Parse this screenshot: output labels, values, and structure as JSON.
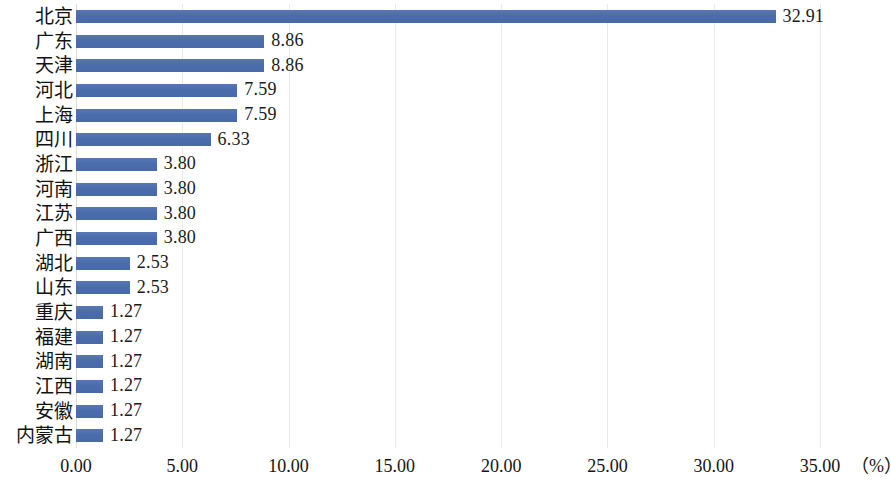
{
  "chart_data": {
    "type": "bar",
    "orientation": "horizontal",
    "title": "",
    "subtitle": "",
    "xlabel": "(%)",
    "ylabel": "",
    "xlim": [
      0,
      35
    ],
    "xticks": [
      "0.00",
      "5.00",
      "10.00",
      "15.00",
      "20.00",
      "25.00",
      "30.00",
      "35.00"
    ],
    "xtick_values": [
      0,
      5,
      10,
      15,
      20,
      25,
      30,
      35
    ],
    "grid": true,
    "grid_axis": "x",
    "legend": false,
    "bar_color": "#4c6fad",
    "value_label_format": "0.00",
    "categories": [
      "北京",
      "广东",
      "天津",
      "河北",
      "上海",
      "四川",
      "浙江",
      "河南",
      "江苏",
      "广西",
      "湖北",
      "山东",
      "重庆",
      "福建",
      "湖南",
      "江西",
      "安徽",
      "内蒙古"
    ],
    "values": [
      32.91,
      8.86,
      8.86,
      7.59,
      7.59,
      6.33,
      3.8,
      3.8,
      3.8,
      3.8,
      2.53,
      2.53,
      1.27,
      1.27,
      1.27,
      1.27,
      1.27,
      1.27
    ],
    "value_labels": [
      "32.91",
      "8.86",
      "8.86",
      "7.59",
      "7.59",
      "6.33",
      "3.80",
      "3.80",
      "3.80",
      "3.80",
      "2.53",
      "2.53",
      "1.27",
      "1.27",
      "1.27",
      "1.27",
      "1.27",
      "1.27"
    ]
  }
}
